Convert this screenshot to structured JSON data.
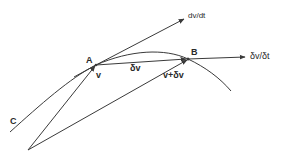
{
  "diagram": {
    "labels": {
      "point_a": "A",
      "point_b": "B",
      "curve_c": "C",
      "velocity_a": "v",
      "delta_v": "δv",
      "velocity_b": "v+δv",
      "dv_dt": "dv/dt",
      "delta_v_over_delta_t": "δv/δt"
    },
    "colors": {
      "line": "#3a3a3a",
      "text": "#2a2a2a",
      "background": "#ffffff"
    }
  }
}
